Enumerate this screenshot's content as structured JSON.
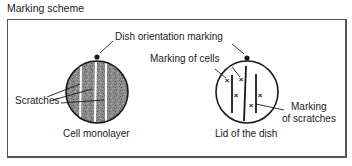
{
  "title": "Marking scheme",
  "labels": {
    "orientation": "Dish orientation marking",
    "scratches": "Scratches",
    "cell_monolayer": "Cell monolayer",
    "marking_cells": "Marking of cells",
    "marking_scratches_1": "Marking",
    "marking_scratches_2": "of scratches",
    "lid": "Lid of the dish"
  },
  "colors": {
    "line": "#1a1a1a",
    "monolayer_fill": "#8a8a8a",
    "lid_fill": "#ffffff",
    "frame": "#555555"
  },
  "diagram": {
    "left_dish": {
      "type": "cell-monolayer",
      "scratch_count": 3,
      "center": [
        97,
        92
      ],
      "radius": 31
    },
    "right_dish": {
      "type": "lid",
      "scratch_mark_count": 3,
      "cell_mark_count": 5,
      "center": [
        247,
        92
      ],
      "radius": 31
    }
  }
}
